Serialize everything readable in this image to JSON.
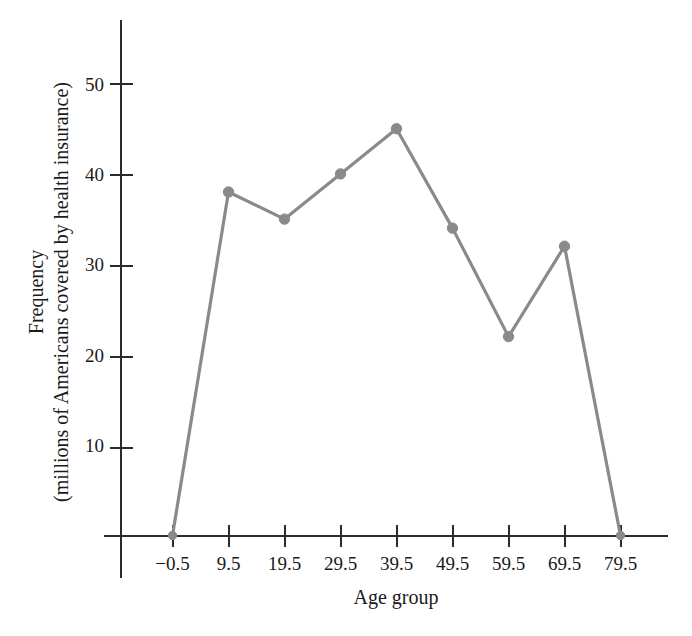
{
  "chart_data": {
    "type": "line",
    "title": "",
    "subtitle": "",
    "xlabel": "Age group",
    "ylabel": "Frequency",
    "ylabel_line1": "Frequency",
    "ylabel_line2": "(millions of Americans covered by health insurance)",
    "categories": [
      "-0.5",
      "9.5",
      "19.5",
      "29.5",
      "39.5",
      "49.5",
      "59.5",
      "69.5",
      "79.5"
    ],
    "x": [
      -0.5,
      9.5,
      19.5,
      29.5,
      39.5,
      49.5,
      59.5,
      69.5,
      79.5
    ],
    "values": [
      0,
      38,
      35,
      40,
      45,
      34,
      22,
      32,
      0
    ],
    "series": [
      {
        "name": "Frequency",
        "values": [
          0,
          38,
          35,
          40,
          45,
          34,
          22,
          32,
          0
        ],
        "color": "#8a8a8a",
        "marker": "circle"
      }
    ],
    "xtick_labels": [
      "−0.5",
      "9.5",
      "19.5",
      "29.5",
      "39.5",
      "49.5",
      "59.5",
      "69.5",
      "79.5"
    ],
    "ytick_labels": [
      "10",
      "20",
      "30",
      "40",
      "50"
    ],
    "ytick_values": [
      10,
      20,
      30,
      40,
      50
    ],
    "ylim": [
      0,
      57
    ],
    "xlim": [
      -5.5,
      87
    ],
    "grid": false,
    "legend": false,
    "legend_position": "none",
    "annotations": []
  },
  "axes": {
    "x_axis_title": "Age group",
    "y_axis_title_outer": "Frequency",
    "y_axis_title_inner": "(millions of Americans covered by health insurance)"
  },
  "colors": {
    "series": "#8a8a8a",
    "axis": "#2b2b2b",
    "text": "#1a1a1a",
    "background": "#ffffff"
  }
}
